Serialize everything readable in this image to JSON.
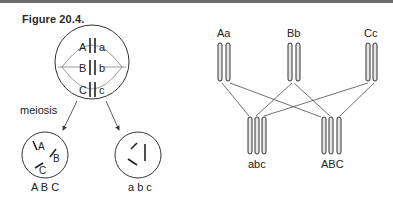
{
  "figure": {
    "title": "Figure 20.4.",
    "left_panel": {
      "parent_cell": {
        "pairs": [
          {
            "left": "A",
            "right": "a"
          },
          {
            "left": "B",
            "right": "b"
          },
          {
            "left": "C",
            "right": "c"
          }
        ]
      },
      "process_label": "meiosis",
      "daughter_cells": [
        {
          "chromosomes": [
            "A",
            "B",
            "C"
          ],
          "caption": "A B C"
        },
        {
          "chromosomes": [
            "a",
            "b",
            "c"
          ],
          "caption": "a b c"
        }
      ]
    },
    "right_panel": {
      "parent_pairs": [
        {
          "label": "Aa"
        },
        {
          "label": "Bb"
        },
        {
          "label": "Cc"
        }
      ],
      "gametes": [
        {
          "label": "abc"
        },
        {
          "label": "ABC"
        }
      ]
    },
    "colors": {
      "topbar": "#6b6b6b",
      "line": "#333333",
      "chromosome_fill": "#e6e6e6"
    }
  }
}
